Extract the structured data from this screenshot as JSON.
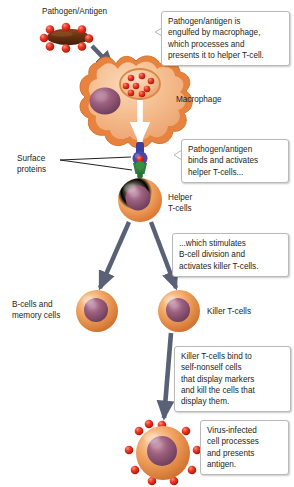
{
  "diagram": {
    "background_color": "#ffffff",
    "palette": {
      "cell_orange_light": "#f7c9a0",
      "cell_orange": "#ef9a57",
      "cell_orange_dark": "#d9742f",
      "nucleus_purple": "#8e5a78",
      "nucleus_purple_dark": "#6e3f5c",
      "antigen_red": "#e02b20",
      "pathogen_brown": "#5c2e12",
      "arrow_slate": "#5a6076",
      "mhc_blue": "#3b3f9e",
      "receptor_green": "#2f7d3a",
      "text_black": "#231f20",
      "callout_border": "#b9b9b9"
    }
  },
  "labels": [
    {
      "id": "pathogen-antigen",
      "text": "Pathogen/Antigen"
    },
    {
      "id": "macrophage",
      "text": "Macrophage"
    },
    {
      "id": "surface-proteins",
      "text": "Surface\nproteins"
    },
    {
      "id": "helper-t-cells",
      "text": "Helper\nT-cells"
    },
    {
      "id": "b-cells-memory-cells",
      "text": "B-cells and\nmemory cells"
    },
    {
      "id": "killer-t-cells",
      "text": "Killer T-cells"
    }
  ],
  "callouts": [
    {
      "id": "engulf",
      "text": "Pathogen/antigen is\nengulfed by macrophage,\nwhich processes and\npresents it to helper T-cell."
    },
    {
      "id": "binds-activates",
      "text": "Pathogen/antigen\nbinds and activates\nhelper T-cells..."
    },
    {
      "id": "stimulates-division",
      "text": "...which stimulates\nB-cell division and\nactivates killer T-cells."
    },
    {
      "id": "killer-binds",
      "text": "Killer T-cells bind to\nself-nonself cells\nthat display markers\nand kill the cells that\ndisplay them."
    },
    {
      "id": "virus-infected",
      "text": "Virus-infected\ncell processes\nand presents\nantigen."
    }
  ],
  "cells": [
    {
      "id": "macrophage-cell",
      "name": "Macrophage",
      "nucleus": true,
      "vesicle_antigen_count": 8
    },
    {
      "id": "helper-t-cell",
      "name": "Helper T-cell",
      "nucleus": true
    },
    {
      "id": "b-cell",
      "name": "B-cell / memory cell",
      "nucleus": true
    },
    {
      "id": "killer-t-cell",
      "name": "Killer T-cell",
      "nucleus": true
    },
    {
      "id": "virus-infected-cell",
      "name": "Virus-infected cell",
      "nucleus": true,
      "spike_count": 10
    }
  ],
  "pathogen": {
    "id": "pathogen-rod",
    "shape": "rod",
    "antigen_dot_count": 8
  },
  "receptor_complex": {
    "mhc": {
      "id": "mhc-molecule",
      "color": "#3b3f9e"
    },
    "antigen": {
      "id": "bound-antigen",
      "color": "#e02b20"
    },
    "tcr": {
      "id": "t-cell-receptor",
      "color": "#2f7d3a"
    }
  },
  "arrows": [
    {
      "id": "arrow-pathogen-to-macrophage",
      "color": "#5a6076"
    },
    {
      "id": "arrow-processing-internal",
      "color": "#ffffff"
    },
    {
      "id": "arrow-helper-to-bcell",
      "color": "#5a6076"
    },
    {
      "id": "arrow-helper-to-killer",
      "color": "#5a6076"
    },
    {
      "id": "arrow-killer-to-infected",
      "color": "#5a6076"
    }
  ]
}
